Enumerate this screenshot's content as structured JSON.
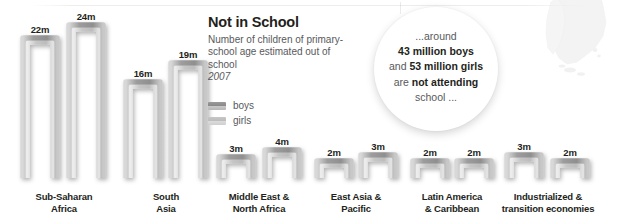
{
  "title": {
    "heading": "Not in School",
    "subtitle": "Number of children of primary-school age estimated out of school",
    "year": "2007"
  },
  "legend": {
    "items": [
      {
        "key": "boys",
        "label": "boys",
        "color": "#8a8a8a"
      },
      {
        "key": "girls",
        "label": "girls",
        "color": "#bdbdbd"
      }
    ]
  },
  "callout": {
    "line1": "...around",
    "line2": "43 million boys",
    "line3_pre": "and ",
    "line3_bold": "53 million girls",
    "line4_pre": "are ",
    "line4_bold": "not attending",
    "line5": "school ..."
  },
  "chart_data": {
    "type": "bar",
    "title": "Not in School",
    "subtitle": "Number of children of primary-school age estimated out of school",
    "year": "2007",
    "xlabel": "",
    "ylabel": "millions of children out of school",
    "unit": "m",
    "ylim": [
      0,
      24
    ],
    "grid": false,
    "legend_position": "left-center",
    "categories": [
      "Sub-Saharan Africa",
      "South Asia",
      "Middle East & North Africa",
      "East Asia & Pacific",
      "Latin America & Caribbean",
      "Industrialized & transition economies"
    ],
    "series": [
      {
        "name": "boys",
        "values": [
          22,
          16,
          3,
          2,
          2,
          3
        ],
        "labels": [
          "22m",
          "16m",
          "3m",
          "2m",
          "2m",
          "3m"
        ]
      },
      {
        "name": "girls",
        "values": [
          24,
          19,
          4,
          3,
          2,
          2
        ],
        "labels": [
          "24m",
          "19m",
          "4m",
          "3m",
          "2m",
          "2m"
        ]
      }
    ],
    "totals": {
      "boys": 43,
      "girls": 53
    },
    "annotations": [
      "...around 43 million boys and 53 million girls are not attending school ..."
    ]
  },
  "bars": [
    {
      "id": "ssa-boys",
      "label": "22m",
      "value": 22,
      "cx": 40,
      "top": 38
    },
    {
      "id": "ssa-girls",
      "label": "24m",
      "value": 24,
      "cx": 86,
      "top": 25
    },
    {
      "id": "sa-boys",
      "label": "16m",
      "value": 16,
      "cx": 143,
      "top": 82
    },
    {
      "id": "sa-girls",
      "label": "19m",
      "value": 19,
      "cx": 188,
      "top": 63
    },
    {
      "id": "mena-boys",
      "label": "3m",
      "value": 3,
      "cx": 236,
      "top": 157
    },
    {
      "id": "mena-girls",
      "label": "4m",
      "value": 4,
      "cx": 282,
      "top": 150
    },
    {
      "id": "eap-boys",
      "label": "2m",
      "value": 2,
      "cx": 334,
      "top": 161
    },
    {
      "id": "eap-girls",
      "label": "3m",
      "value": 3,
      "cx": 378,
      "top": 155
    },
    {
      "id": "lac-boys",
      "label": "2m",
      "value": 2,
      "cx": 430,
      "top": 161
    },
    {
      "id": "lac-girls",
      "label": "2m",
      "value": 2,
      "cx": 474,
      "top": 161
    },
    {
      "id": "ind-boys",
      "label": "3m",
      "value": 3,
      "cx": 524,
      "top": 155
    },
    {
      "id": "ind-girls",
      "label": "2m",
      "value": 2,
      "cx": 570,
      "top": 161
    }
  ],
  "regions": [
    {
      "id": "sub-saharan-africa",
      "line1": "Sub-Saharan",
      "line2": "Africa",
      "cx": 64
    },
    {
      "id": "south-asia",
      "line1": "South",
      "line2": "Asia",
      "cx": 166
    },
    {
      "id": "middle-east-n-africa",
      "line1": "Middle East &",
      "line2": "North Africa",
      "cx": 259
    },
    {
      "id": "east-asia-pacific",
      "line1": "East Asia &",
      "line2": "Pacific",
      "cx": 356
    },
    {
      "id": "latin-america",
      "line1": "Latin America",
      "line2": "& Caribbean",
      "cx": 452
    },
    {
      "id": "industrialized",
      "line1": "Industrialized &",
      "line2": "transition economies",
      "cx": 548
    }
  ]
}
